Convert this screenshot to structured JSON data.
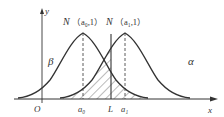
{
  "diagram": {
    "type": "two normal distribution curves with hatched error regions",
    "axes": {
      "x_label": "x",
      "y_label": "y",
      "origin_label": "O"
    },
    "curves": [
      {
        "name": "null-distribution",
        "label": "N（a₀,1）",
        "label_main": "N",
        "label_param": "（a₀,1）",
        "mean_label": "a₀"
      },
      {
        "name": "alternative-distribution",
        "label": "N（a₁,1）",
        "label_main": "N",
        "label_param": "（a₁,1）",
        "mean_label": "a₁"
      }
    ],
    "threshold_label": "L",
    "region_labels": {
      "beta": "β",
      "alpha": "α"
    },
    "colors": {
      "stroke": "#333333",
      "background": "#ffffff"
    }
  }
}
